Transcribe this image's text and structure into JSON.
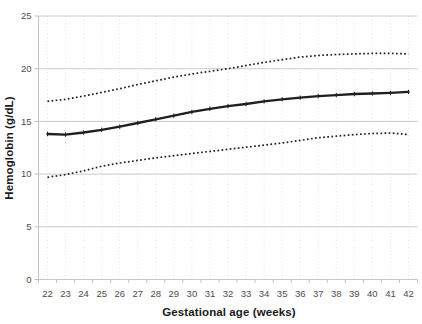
{
  "figure": {
    "background_color": "#ffffff",
    "plot_border": "none",
    "legend": "none",
    "title": ""
  },
  "chart_data": {
    "type": "line",
    "title": "",
    "xlabel": "Gestational age (weeks)",
    "ylabel": "Hemoglobin (g/dL)",
    "x": [
      22,
      23,
      24,
      25,
      26,
      27,
      28,
      29,
      30,
      31,
      32,
      33,
      34,
      35,
      36,
      37,
      38,
      39,
      40,
      41,
      42
    ],
    "x_tick_labels": [
      "22",
      "23",
      "24",
      "25",
      "26",
      "27",
      "28",
      "29",
      "30",
      "31",
      "32",
      "33",
      "34",
      "35",
      "36",
      "37",
      "38",
      "39",
      "40",
      "41",
      "42"
    ],
    "yticks": [
      0,
      5,
      10,
      15,
      20,
      25
    ],
    "ylim": [
      0,
      25
    ],
    "grid": {
      "horizontal_solid": true,
      "vertical_dotted": true
    },
    "series": [
      {
        "name": "upper-limit",
        "style": "dotted",
        "color": "#1f1f1f",
        "values": [
          16.9,
          17.1,
          17.4,
          17.75,
          18.1,
          18.5,
          18.85,
          19.2,
          19.5,
          19.75,
          20.0,
          20.3,
          20.6,
          20.85,
          21.1,
          21.25,
          21.35,
          21.4,
          21.45,
          21.45,
          21.4
        ]
      },
      {
        "name": "mean",
        "style": "solid",
        "color": "#1f1f1f",
        "values": [
          13.8,
          13.75,
          13.95,
          14.2,
          14.5,
          14.85,
          15.2,
          15.55,
          15.9,
          16.2,
          16.45,
          16.65,
          16.9,
          17.1,
          17.25,
          17.4,
          17.5,
          17.6,
          17.65,
          17.7,
          17.8
        ]
      },
      {
        "name": "lower-limit",
        "style": "dotted",
        "color": "#1f1f1f",
        "values": [
          9.7,
          9.95,
          10.3,
          10.75,
          11.05,
          11.3,
          11.55,
          11.75,
          11.95,
          12.15,
          12.35,
          12.55,
          12.75,
          12.95,
          13.2,
          13.45,
          13.6,
          13.75,
          13.85,
          13.9,
          13.75
        ]
      }
    ],
    "colors": {
      "gridline": "#c9c9c9",
      "vertical_gridline": "#e4e4e4",
      "axis_line": "#c0c0c0",
      "tick_label": "#4d4d4d",
      "axis_title": "#1a1a1a"
    }
  }
}
